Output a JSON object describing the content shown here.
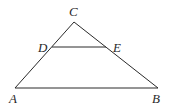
{
  "diagram": {
    "type": "triangle with parallel segment",
    "points": {
      "A": {
        "label": "A"
      },
      "B": {
        "label": "B"
      },
      "C": {
        "label": "C"
      },
      "D": {
        "label": "D"
      },
      "E": {
        "label": "E"
      }
    },
    "segments": [
      "AB",
      "BC",
      "CA",
      "DE"
    ],
    "relations": [
      "D lies on AC",
      "E lies on BC",
      "DE parallel to AB"
    ]
  }
}
